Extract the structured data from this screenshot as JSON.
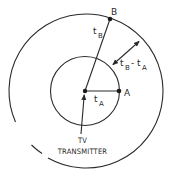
{
  "diagram": {
    "points": {
      "A": {
        "label": "A"
      },
      "B": {
        "label": "B"
      }
    },
    "labels": {
      "t_B": {
        "main": "t",
        "sub": "B"
      },
      "t_A": {
        "main": "t",
        "sub": "A"
      },
      "difference": {
        "main1": "t",
        "sub1": "B",
        "minus": "-",
        "main2": "t",
        "sub2": "A"
      }
    },
    "caption": {
      "line1": "TV",
      "line2": "TRANSMITTER"
    },
    "colors": {
      "stroke": "#2a2a2a",
      "background": "#ffffff"
    }
  }
}
